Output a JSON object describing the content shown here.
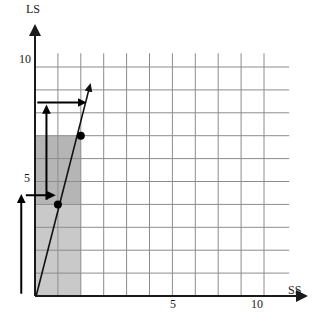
{
  "figure": {
    "title": "",
    "axis_labels": {
      "y": "LS",
      "x": "SS"
    },
    "y_ticks": [
      {
        "value": 10,
        "label": "10"
      },
      {
        "value": 5,
        "label": "5"
      }
    ],
    "x_ticks": [
      {
        "value": 5,
        "label": "5"
      },
      {
        "value": 10,
        "label": "10"
      }
    ]
  },
  "colors": {
    "grid": "#8c8c8c",
    "axis": "#1a1a1a",
    "shade_dark": "#b5b5b5",
    "shade_light": "#c9c9c9",
    "line": "#111111",
    "dot": "#000000",
    "background": "#ffffff"
  },
  "chart_data": {
    "type": "scatter",
    "title": "",
    "xlabel": "SS",
    "ylabel": "LS",
    "xlim": [
      0,
      11.2
    ],
    "ylim": [
      0,
      11.2
    ],
    "grid": true,
    "x_tick_labels": [
      "5",
      "10"
    ],
    "x_tick_values": [
      5,
      10
    ],
    "y_tick_labels": [
      "5",
      "10"
    ],
    "y_tick_values": [
      5,
      10
    ],
    "gridlines_x": [
      0,
      1,
      2,
      3,
      4,
      5,
      6,
      7,
      8,
      9,
      10
    ],
    "gridlines_y": [
      0,
      1,
      2,
      3,
      4,
      5,
      6,
      7,
      8,
      9,
      10
    ],
    "legend": [],
    "points": [
      {
        "name": "lower-equilibrium-point",
        "x": 1,
        "y": 4
      },
      {
        "name": "upper-equilibrium-point",
        "x": 2,
        "y": 7
      }
    ],
    "series": [
      {
        "name": "best-response-line",
        "type": "line",
        "x": [
          0.05,
          2.35
        ],
        "y": [
          0.0,
          9.0
        ],
        "arrow_head": "end",
        "slope": 3.0
      }
    ],
    "shaded_regions": [
      {
        "name": "lower-band",
        "x0": 0,
        "x1": 1,
        "y0": 0,
        "y1": 4,
        "shade": "light"
      },
      {
        "name": "middle-band",
        "x0": 0,
        "x1": 2,
        "y0": 4,
        "y1": 7,
        "shade": "dark"
      },
      {
        "name": "lower-right-band",
        "x0": 1,
        "x1": 2,
        "y0": 0,
        "y1": 4,
        "shade": "light"
      }
    ],
    "annotation_arrows": [
      {
        "name": "arrow-up-outside-axis",
        "orientation": "vertical",
        "x": -0.6,
        "y0": 0.1,
        "y1": 4.1,
        "direction": "up"
      },
      {
        "name": "arrow-right-at-y4",
        "orientation": "horizontal",
        "y": 4.4,
        "x0": -0.4,
        "x1": 0.55,
        "direction": "right"
      },
      {
        "name": "arrow-up-inside-band",
        "orientation": "vertical",
        "x": 0.5,
        "y0": 4.2,
        "y1": 8.0,
        "direction": "up"
      },
      {
        "name": "arrow-right-at-y7",
        "orientation": "horizontal",
        "y": 8.45,
        "x0": 0.1,
        "x1": 1.9,
        "direction": "right"
      }
    ]
  }
}
